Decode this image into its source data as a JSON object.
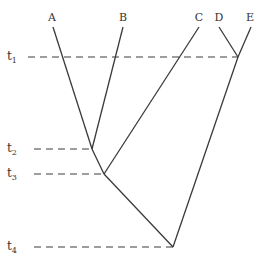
{
  "diagram": {
    "type": "phylogenetic-tree",
    "taxa": [
      {
        "id": "A",
        "label": "A",
        "x": 52,
        "y": 18
      },
      {
        "id": "B",
        "label": "B",
        "x": 123,
        "y": 18
      },
      {
        "id": "C",
        "label": "C",
        "x": 198,
        "y": 18
      },
      {
        "id": "D",
        "label": "D",
        "x": 219,
        "y": 18
      },
      {
        "id": "E",
        "label": "E",
        "x": 250,
        "y": 18
      }
    ],
    "time_markers": [
      {
        "id": "t1",
        "base": "t",
        "sub": "1",
        "y": 57,
        "node_x": 238
      },
      {
        "id": "t2",
        "base": "t",
        "sub": "2",
        "y": 149,
        "node_x": 92
      },
      {
        "id": "t3",
        "base": "t",
        "sub": "3",
        "y": 174,
        "node_x": 104
      },
      {
        "id": "t4",
        "base": "t",
        "sub": "4",
        "y": 247,
        "node_x": 173
      }
    ],
    "branches": [
      {
        "from": "A",
        "to": "t2"
      },
      {
        "from": "B",
        "to": "t2"
      },
      {
        "from": "t2",
        "to": "t3"
      },
      {
        "from": "C",
        "to": "t3"
      },
      {
        "from": "D",
        "to": "t1"
      },
      {
        "from": "E",
        "to": "t1"
      },
      {
        "from": "t3",
        "to": "t4"
      },
      {
        "from": "t1",
        "to": "t4"
      }
    ]
  }
}
